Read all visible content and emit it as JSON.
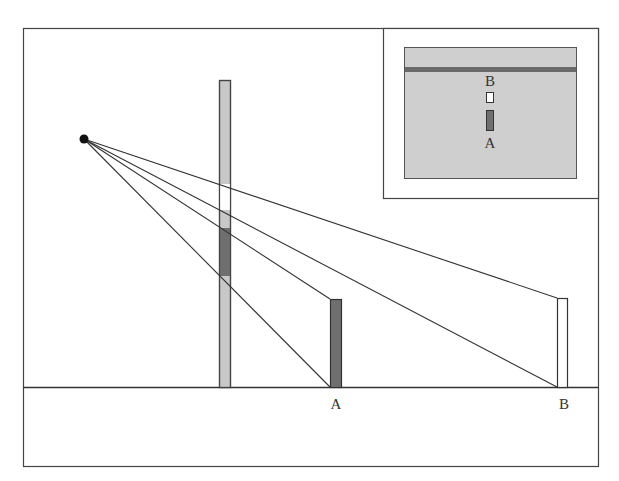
{
  "diagram": {
    "title": "",
    "colors": {
      "background": "#ffffff",
      "stroke": "#333333",
      "picture_plane": "#c8c8c8",
      "object_a": "#6f6f6f",
      "object_b": "#ffffff",
      "inset_panel": "#cfcfcf",
      "horizon_band": "#6a6a6a"
    },
    "labels": {
      "object_a": "A",
      "object_b": "B",
      "inset_a": "A",
      "inset_b": "B"
    },
    "elements": {
      "eye_point": {
        "x": 84,
        "y": 139
      },
      "ground_line_y": 387,
      "picture_plane": {
        "x": 219,
        "width": 11,
        "top": 80,
        "bottom": 387
      },
      "projection_of_b_on_plane": {
        "top": 184,
        "bottom": 210
      },
      "projection_of_a_on_plane": {
        "top": 228,
        "bottom": 276
      },
      "object_a": {
        "x": 330,
        "width": 11,
        "top": 299,
        "bottom": 387
      },
      "object_b": {
        "x": 557,
        "width": 10,
        "top": 298,
        "bottom": 387
      }
    }
  }
}
